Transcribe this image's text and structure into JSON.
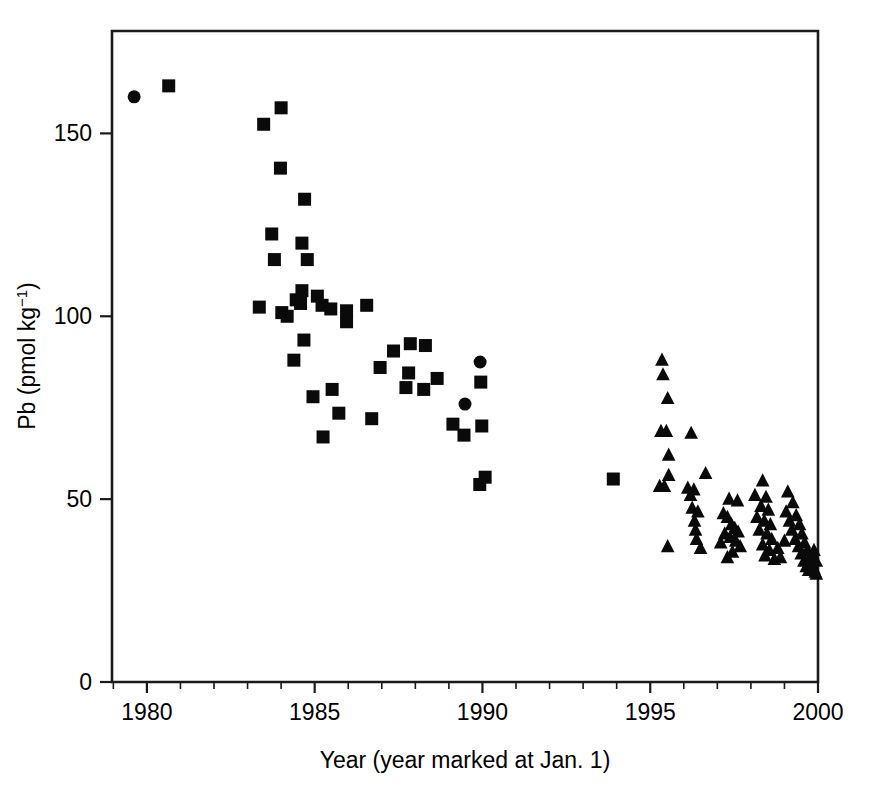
{
  "figure": {
    "background_color": "#ffffff",
    "marker_color": "#0a0a0a",
    "axis_color": "#1a1a1a"
  },
  "axes": {
    "x_title_text": "Year (year marked at Jan. 1)",
    "y_title_main": "Pb (pmol kg",
    "y_title_sup": "−1",
    "y_title_tail": ")",
    "y_title_full": "Pb (pmol kg−1)"
  },
  "chart_data": {
    "type": "scatter",
    "title": "",
    "xlabel": "Year (year marked at Jan. 1)",
    "ylabel": "Pb (pmol kg−1)",
    "xlim": [
      1978.96,
      2000.0
    ],
    "ylim": [
      0,
      178.0
    ],
    "xticks": [
      1980,
      1985,
      1990,
      1995,
      2000
    ],
    "xticklabels": [
      "1980",
      "1985",
      "1990",
      "1995",
      "2000"
    ],
    "xminor_step": 1,
    "yticks": [
      0,
      50,
      100,
      150
    ],
    "yticklabels": [
      "0",
      "50",
      "100",
      "150"
    ],
    "grid": false,
    "legend": "none",
    "series": [
      {
        "name": "circle-series",
        "marker": "circle",
        "color": "#0a0a0a",
        "size": 13,
        "points": [
          [
            1979.62,
            160.0
          ],
          [
            1989.48,
            76.0
          ],
          [
            1989.93,
            87.5
          ]
        ]
      },
      {
        "name": "square-series",
        "marker": "square",
        "color": "#0a0a0a",
        "size": 13,
        "points": [
          [
            1980.65,
            163.0
          ],
          [
            1983.48,
            152.5
          ],
          [
            1984.0,
            157.0
          ],
          [
            1983.98,
            140.5
          ],
          [
            1984.7,
            132.0
          ],
          [
            1983.72,
            122.5
          ],
          [
            1984.62,
            120.0
          ],
          [
            1983.8,
            115.5
          ],
          [
            1984.78,
            115.5
          ],
          [
            1983.35,
            102.5
          ],
          [
            1984.02,
            101.0
          ],
          [
            1984.45,
            104.5
          ],
          [
            1984.58,
            103.5
          ],
          [
            1984.62,
            107.0
          ],
          [
            1985.08,
            105.5
          ],
          [
            1985.22,
            103.0
          ],
          [
            1984.18,
            100.0
          ],
          [
            1985.48,
            102.0
          ],
          [
            1985.95,
            98.5
          ],
          [
            1985.95,
            101.5
          ],
          [
            1986.55,
            103.0
          ],
          [
            1984.68,
            93.5
          ],
          [
            1984.38,
            88.0
          ],
          [
            1987.35,
            90.5
          ],
          [
            1987.85,
            92.5
          ],
          [
            1988.3,
            92.0
          ],
          [
            1986.95,
            86.0
          ],
          [
            1987.8,
            84.5
          ],
          [
            1988.65,
            83.0
          ],
          [
            1989.95,
            82.0
          ],
          [
            1984.95,
            78.0
          ],
          [
            1985.52,
            80.0
          ],
          [
            1987.72,
            80.5
          ],
          [
            1988.25,
            80.0
          ],
          [
            1985.72,
            73.5
          ],
          [
            1986.7,
            72.0
          ],
          [
            1989.12,
            70.5
          ],
          [
            1989.98,
            70.0
          ],
          [
            1985.25,
            67.0
          ],
          [
            1989.45,
            67.5
          ],
          [
            1989.92,
            54.0
          ],
          [
            1990.08,
            56.0
          ],
          [
            1993.9,
            55.5
          ]
        ]
      },
      {
        "name": "triangle-series",
        "marker": "triangle",
        "color": "#0a0a0a",
        "size": 13,
        "points": [
          [
            1995.35,
            88.0
          ],
          [
            1995.38,
            84.0
          ],
          [
            1995.52,
            77.5
          ],
          [
            1995.32,
            68.5
          ],
          [
            1995.48,
            68.5
          ],
          [
            1996.22,
            68.0
          ],
          [
            1995.55,
            62.0
          ],
          [
            1995.55,
            56.5
          ],
          [
            1996.65,
            57.0
          ],
          [
            1995.28,
            53.5
          ],
          [
            1995.42,
            53.5
          ],
          [
            1996.12,
            53.0
          ],
          [
            1996.2,
            51.0
          ],
          [
            1996.3,
            52.5
          ],
          [
            1996.25,
            47.5
          ],
          [
            1996.42,
            46.5
          ],
          [
            1996.32,
            44.0
          ],
          [
            1996.35,
            41.5
          ],
          [
            1996.38,
            39.0
          ],
          [
            1995.52,
            37.0
          ],
          [
            1997.35,
            50.0
          ],
          [
            1997.6,
            49.5
          ],
          [
            1997.18,
            46.0
          ],
          [
            1997.3,
            45.0
          ],
          [
            1997.42,
            43.0
          ],
          [
            1997.52,
            42.0
          ],
          [
            1997.62,
            41.0
          ],
          [
            1997.22,
            40.5
          ],
          [
            1997.38,
            39.5
          ],
          [
            1997.55,
            38.5
          ],
          [
            1997.68,
            37.0
          ],
          [
            1997.45,
            35.5
          ],
          [
            1997.3,
            34.0
          ],
          [
            1998.35,
            55.0
          ],
          [
            1998.12,
            51.0
          ],
          [
            1998.45,
            50.5
          ],
          [
            1998.3,
            48.0
          ],
          [
            1998.52,
            47.0
          ],
          [
            1998.18,
            45.0
          ],
          [
            1998.4,
            44.0
          ],
          [
            1998.58,
            43.0
          ],
          [
            1998.25,
            41.5
          ],
          [
            1998.48,
            40.5
          ],
          [
            1998.62,
            39.0
          ],
          [
            1998.35,
            37.5
          ],
          [
            1998.55,
            36.0
          ],
          [
            1998.42,
            34.5
          ],
          [
            1998.7,
            33.5
          ],
          [
            1999.1,
            52.0
          ],
          [
            1999.25,
            49.0
          ],
          [
            1999.05,
            46.5
          ],
          [
            1999.35,
            45.5
          ],
          [
            1999.15,
            44.0
          ],
          [
            1999.45,
            43.0
          ],
          [
            1999.22,
            41.5
          ],
          [
            1999.52,
            40.5
          ],
          [
            1999.32,
            39.0
          ],
          [
            1999.6,
            38.0
          ],
          [
            1999.42,
            37.0
          ],
          [
            1999.68,
            36.0
          ],
          [
            1999.5,
            35.0
          ],
          [
            1999.75,
            34.0
          ],
          [
            1999.58,
            33.0
          ],
          [
            1999.82,
            32.5
          ],
          [
            1999.65,
            31.5
          ],
          [
            1999.88,
            31.0
          ],
          [
            1999.72,
            30.5
          ],
          [
            1999.92,
            30.0
          ],
          [
            1999.8,
            34.5
          ],
          [
            1999.95,
            33.0
          ],
          [
            1999.88,
            36.0
          ],
          [
            1998.8,
            36.5
          ],
          [
            1998.88,
            34.0
          ],
          [
            1999.0,
            38.5
          ],
          [
            1997.1,
            38.0
          ],
          [
            1996.5,
            36.5
          ],
          [
            1999.95,
            29.5
          ]
        ]
      }
    ]
  }
}
